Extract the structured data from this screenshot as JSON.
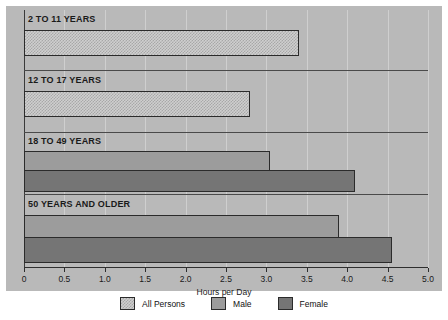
{
  "chart_data": {
    "type": "bar",
    "orientation": "horizontal",
    "title": "",
    "xlabel": "Hours per Day",
    "ylabel": "",
    "xlim": [
      0,
      5.0
    ],
    "xticks": [
      "0",
      "0.5",
      "1.0",
      "1.5",
      "2.0",
      "2.5",
      "3.0",
      "3.5",
      "4.0",
      "4.5",
      "5.0"
    ],
    "xtick_values": [
      0,
      0.5,
      1.0,
      1.5,
      2.0,
      2.5,
      3.0,
      3.5,
      4.0,
      4.5,
      5.0
    ],
    "grid": true,
    "legend_position": "bottom",
    "categories": [
      "2 TO 11 YEARS",
      "12 TO 17 YEARS",
      "18 TO 49 YEARS",
      "50 YEARS AND OLDER"
    ],
    "series": [
      {
        "name": "All Persons",
        "color": "#cfcfcf",
        "values": [
          3.4,
          2.8,
          null,
          null
        ]
      },
      {
        "name": "Male",
        "color": "#9c9c9c",
        "values": [
          null,
          null,
          3.05,
          3.9
        ]
      },
      {
        "name": "Female",
        "color": "#757575",
        "values": [
          null,
          null,
          4.1,
          4.55
        ]
      }
    ],
    "groups": [
      {
        "label": "2 TO 11 YEARS",
        "bars": [
          {
            "series": "All Persons",
            "value": 3.4
          }
        ]
      },
      {
        "label": "12 TO 17 YEARS",
        "bars": [
          {
            "series": "All Persons",
            "value": 2.8
          }
        ]
      },
      {
        "label": "18 TO 49 YEARS",
        "bars": [
          {
            "series": "Male",
            "value": 3.05
          },
          {
            "series": "Female",
            "value": 4.1
          }
        ]
      },
      {
        "label": "50 YEARS AND OLDER",
        "bars": [
          {
            "series": "Male",
            "value": 3.9
          },
          {
            "series": "Female",
            "value": 4.55
          }
        ]
      }
    ]
  },
  "legend": {
    "items": [
      {
        "label": "All Persons",
        "swatch": "all"
      },
      {
        "label": "Male",
        "swatch": "male"
      },
      {
        "label": "Female",
        "swatch": "female"
      }
    ]
  },
  "axis": {
    "x_title": "Hours per Day"
  },
  "colors": {
    "panel_background": "#b9b9b9",
    "page_background": "#ffffff",
    "gridline": "#cfcfcf",
    "axis_line": "#2e2e2e",
    "bar_outline": "#2b2b2b",
    "all_persons": "#cfcfcf",
    "male": "#9c9c9c",
    "female": "#757575",
    "text": "#1a1a1a"
  }
}
